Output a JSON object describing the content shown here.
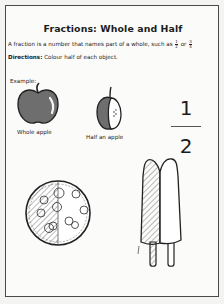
{
  "worksheet": {
    "title": "Fractions: Whole and Half",
    "intro_text": "A fraction is a number that names part of a whole, such as",
    "intro_fraction_1": {
      "numerator": "1",
      "denominator": "2"
    },
    "intro_connector": "or",
    "intro_fraction_2": {
      "numerator": "3",
      "denominator": "4"
    },
    "directions_label": "Directions:",
    "directions_text": "Colour half of each object.",
    "example_label": "Example:",
    "examples": [
      {
        "image": "whole-apple-icon",
        "caption": "Whole apple"
      },
      {
        "image": "half-apple-icon",
        "caption": "Half an apple"
      }
    ],
    "fraction_display": {
      "numerator": "1",
      "denominator": "2"
    },
    "objects": [
      {
        "image": "pizza-icon",
        "state": "left half shaded"
      },
      {
        "image": "double-popsicle-icon",
        "state": "left half shaded"
      }
    ],
    "colors": {
      "frame": "#4a4a4a",
      "apple_fill": "#6e6e6e",
      "ink": "#1c1c1c",
      "paper": "#fbfbfa"
    }
  }
}
